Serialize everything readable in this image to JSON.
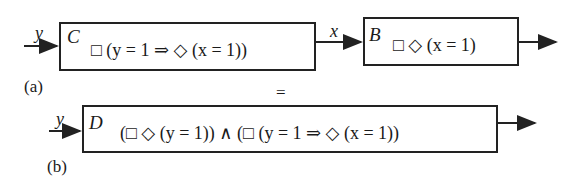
{
  "diagram": {
    "part_a": {
      "caption": "(a)",
      "input_signal": "y",
      "component_c": {
        "name": "C",
        "formula": "□ (y = 1 ⇒ ◇ (x = 1))"
      },
      "link_signal": "x",
      "component_b": {
        "name": "B",
        "formula": "□ ◇ (x = 1)"
      }
    },
    "equivalence": "=",
    "part_b": {
      "caption": "(b)",
      "input_signal": "y",
      "component_d": {
        "name": "D",
        "formula": "(□ ◇ (y = 1)) ∧ (□ (y = 1 ⇒ ◇ (x = 1))"
      }
    }
  }
}
